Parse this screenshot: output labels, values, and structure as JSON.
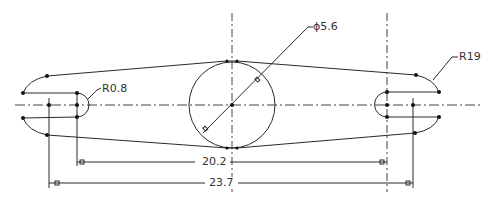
{
  "drawing": {
    "type": "2D mechanical sketch - slotted link with central hole",
    "colors": {
      "background": "#ffffff",
      "line": "#2a2a2a",
      "text": "#333333"
    },
    "annotations": {
      "diameter": {
        "label": "ϕ5.6",
        "kind": "diameter"
      },
      "left_slot_radius": {
        "label": "R0.8",
        "kind": "radius"
      },
      "right_end_radius": {
        "label": "R19",
        "kind": "radius"
      },
      "inner_distance": {
        "label": "20.2",
        "kind": "linear"
      },
      "outer_distance": {
        "label": "23.7",
        "kind": "linear"
      }
    }
  }
}
